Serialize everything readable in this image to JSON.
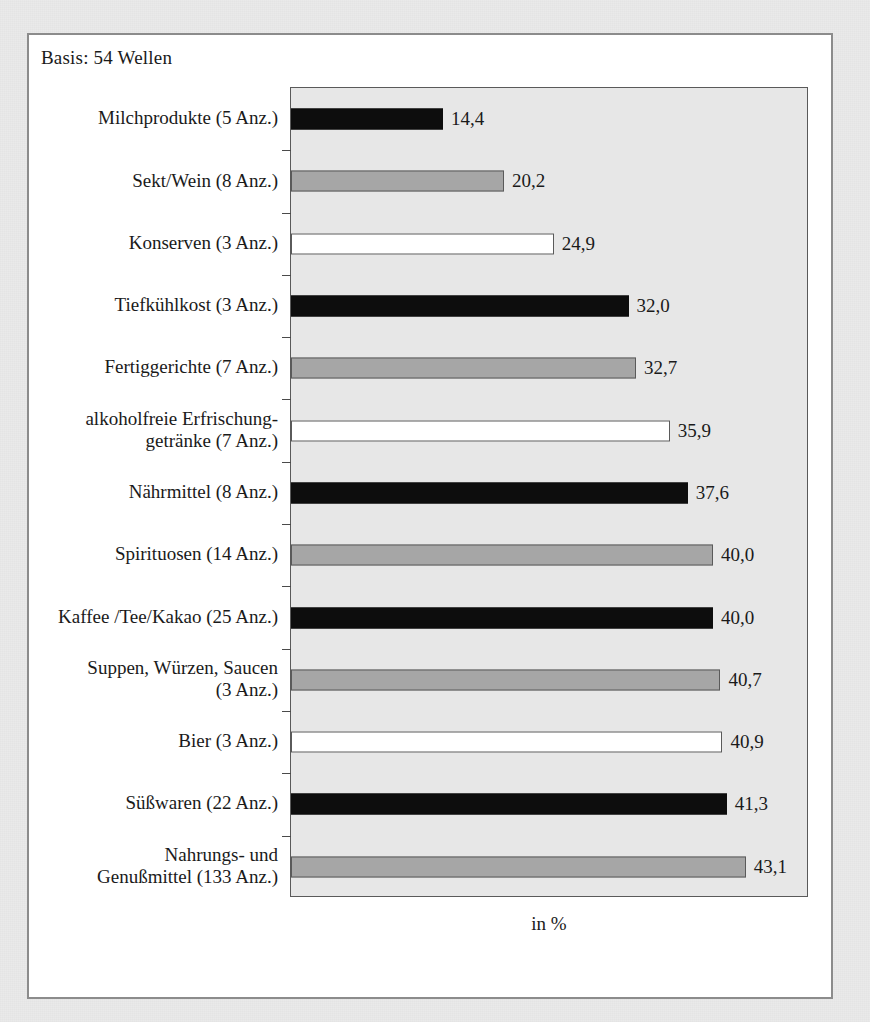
{
  "note": {
    "basis": "Basis: 54 Wellen"
  },
  "chart_data": {
    "type": "bar",
    "orientation": "horizontal",
    "title": "",
    "subtitle": "",
    "xlabel": "in %",
    "ylabel": "",
    "xlim": [
      0,
      50
    ],
    "grid": false,
    "legend": "none",
    "categories": [
      "Milchprodukte (5 Anz.)",
      "Sekt/Wein (8 Anz.)",
      "Konserven (3 Anz.)",
      "Tiefkühlkost (3 Anz.)",
      "Fertiggerichte (7 Anz.)",
      "alkoholfreie Erfrischung-\ngetränke (7 Anz.)",
      "Nährmittel (8 Anz.)",
      "Spirituosen (14 Anz.)",
      "Kaffee /Tee/Kakao (25 Anz.)",
      "Suppen, Würzen, Saucen\n(3 Anz.)",
      "Bier (3 Anz.)",
      "Süßwaren (22 Anz.)",
      "Nahrungs- und\nGenußmittel (133 Anz.)"
    ],
    "category_lines": [
      [
        "Milchprodukte (5 Anz.)"
      ],
      [
        "Sekt/Wein (8 Anz.)"
      ],
      [
        "Konserven (3 Anz.)"
      ],
      [
        "Tiefkühlkost (3 Anz.)"
      ],
      [
        "Fertiggerichte (7 Anz.)"
      ],
      [
        "alkoholfreie Erfrischung-",
        "getränke (7 Anz.)"
      ],
      [
        "Nährmittel (8 Anz.)"
      ],
      [
        "Spirituosen (14 Anz.)"
      ],
      [
        "Kaffee /Tee/Kakao (25 Anz.)"
      ],
      [
        "Suppen, Würzen, Saucen",
        "(3 Anz.)"
      ],
      [
        "Bier (3 Anz.)"
      ],
      [
        "Süßwaren (22 Anz.)"
      ],
      [
        "Nahrungs- und",
        "Genußmittel (133 Anz.)"
      ]
    ],
    "values": [
      14.4,
      20.2,
      24.9,
      32.0,
      32.7,
      35.9,
      37.6,
      40.0,
      40.0,
      40.7,
      40.9,
      41.3,
      43.1
    ],
    "value_labels": [
      "14,4",
      "20,2",
      "24,9",
      "32,0",
      "32,7",
      "35,9",
      "37,6",
      "40,0",
      "40,0",
      "40,7",
      "40,9",
      "41,3",
      "43,1"
    ],
    "bar_fills": [
      "black",
      "gray",
      "white",
      "black",
      "gray",
      "white",
      "black",
      "gray",
      "black",
      "gray",
      "white",
      "black",
      "gray"
    ],
    "colors": {
      "black": "#0d0d0d",
      "gray": "#a6a6a6",
      "white": "#ffffff",
      "bar_outline": "#4a4a4a",
      "plot_background": "#e7e7e7",
      "card_background": "#ffffff",
      "page_background": "#eaeaea",
      "frame": "#8c8c8c",
      "text": "#1a1a1a"
    }
  }
}
